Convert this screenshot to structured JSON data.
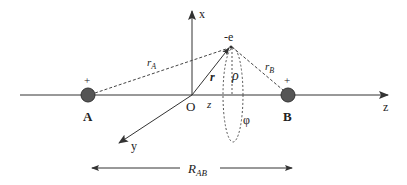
{
  "diagram": {
    "type": "coordinate-geometry",
    "colors": {
      "line": "#333333",
      "charge_fill": "#555555",
      "charge_stroke": "#333333",
      "text": "#222222",
      "background": "#ffffff"
    },
    "axes": {
      "x_label": "x",
      "y_label": "y",
      "z_label": "z",
      "origin_label": "O"
    },
    "nuclei": [
      {
        "id": "A",
        "label": "A",
        "charge": "+"
      },
      {
        "id": "B",
        "label": "B",
        "charge": "+"
      }
    ],
    "electron": {
      "label": "-e"
    },
    "vectors": {
      "r_A": {
        "main": "r",
        "sub": "A"
      },
      "r_B": {
        "main": "r",
        "sub": "B"
      },
      "r": "r",
      "rho": "ρ",
      "z": "z",
      "phi": "φ"
    },
    "separation": {
      "main": "R",
      "sub": "AB"
    }
  }
}
